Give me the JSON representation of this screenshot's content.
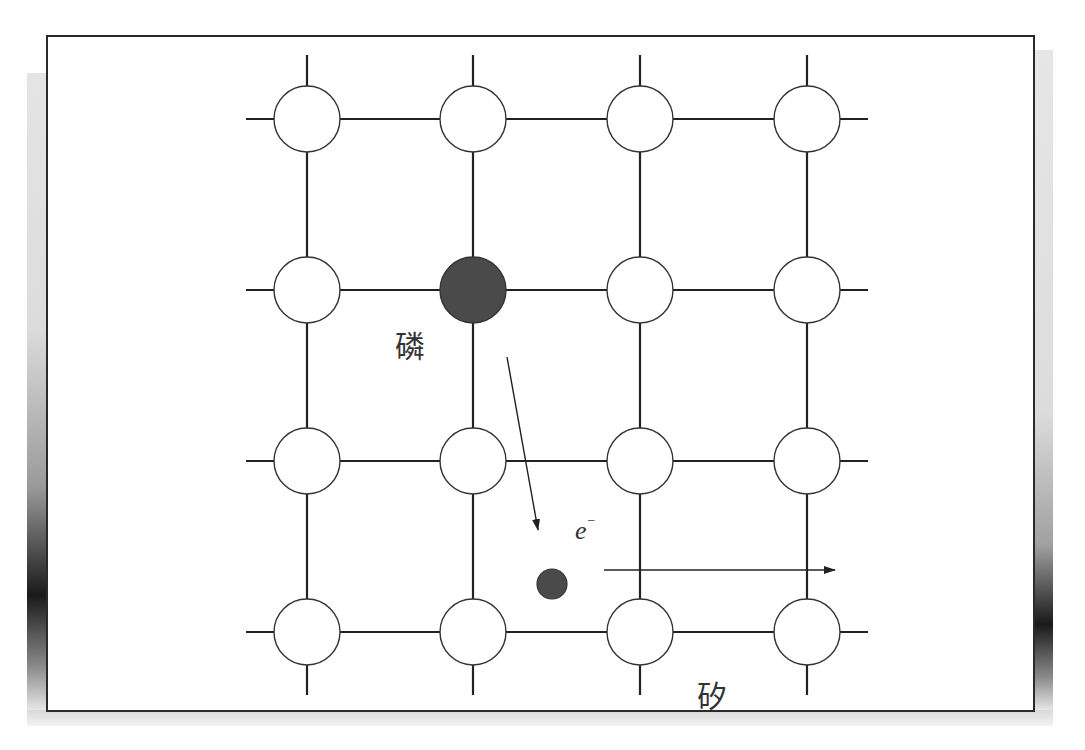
{
  "diagram": {
    "title": "",
    "labels": {
      "phosphorus": "磷",
      "silicon": "矽",
      "electron": "e",
      "electron_charge": "−"
    },
    "lattice": {
      "columns_x": [
        307,
        473,
        640,
        807
      ],
      "rows_y": [
        119,
        290,
        461,
        632
      ],
      "atom_radius": 33,
      "grid_extent": {
        "x_min": 246,
        "x_max": 868,
        "y_min": 55,
        "y_max": 695
      },
      "dopant_atom": {
        "col": 1,
        "row": 1,
        "element": "phosphorus",
        "fill": "#4a4a4a"
      },
      "host_atom": {
        "element": "silicon",
        "fill": "#ffffff"
      }
    },
    "electron_particle": {
      "cx": 552,
      "cy": 584,
      "r": 15,
      "fill": "#4a4a4a"
    },
    "arrows": [
      {
        "name": "release-arrow",
        "x1": 507,
        "y1": 357,
        "x2": 538,
        "y2": 530
      },
      {
        "name": "drift-arrow",
        "x1": 604,
        "y1": 570,
        "x2": 835,
        "y2": 570
      }
    ],
    "colors": {
      "line": "#222222",
      "frame": "#2a2a2a",
      "filled": "#4a4a4a"
    }
  }
}
